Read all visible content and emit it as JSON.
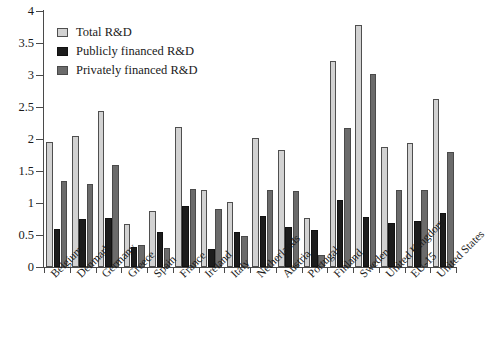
{
  "chart_data": {
    "type": "bar",
    "title": "",
    "subtitle": "",
    "xlabel": "",
    "ylabel": "",
    "ylim": [
      0,
      4
    ],
    "yticks": [
      "0",
      "0.5",
      "1",
      "1.5",
      "2",
      "2.5",
      "3",
      "3.5",
      "4"
    ],
    "ytick_values": [
      0,
      0.5,
      1,
      1.5,
      2,
      2.5,
      3,
      3.5,
      4
    ],
    "grid": false,
    "legend_position": "upper-left",
    "categories": [
      "Belgium",
      "Denmark",
      "Germany",
      "Greece",
      "Spain",
      "France",
      "Ireland",
      "Italy",
      "Netherlands",
      "Austria",
      "Portugal",
      "Finland",
      "Sweden",
      "United Kingdom",
      "EU-15",
      "United States"
    ],
    "series": [
      {
        "name": "Total R&D",
        "color": "#d2d2d2",
        "values": [
          1.95,
          2.05,
          2.44,
          0.67,
          0.88,
          2.18,
          1.21,
          1.02,
          2.02,
          1.83,
          0.76,
          3.22,
          3.78,
          1.88,
          1.93,
          2.62
        ]
      },
      {
        "name": "Publicly financed R&D",
        "color": "#1c1c1c",
        "values": [
          0.6,
          0.75,
          0.77,
          0.32,
          0.55,
          0.95,
          0.28,
          0.55,
          0.8,
          0.62,
          0.58,
          1.05,
          0.78,
          0.68,
          0.72,
          0.85
        ]
      },
      {
        "name": "Privately financed R&D",
        "color": "#6b6b6b",
        "values": [
          1.35,
          1.3,
          1.6,
          0.35,
          0.3,
          1.22,
          0.9,
          0.48,
          1.2,
          1.18,
          0.18,
          2.17,
          3.02,
          1.2,
          1.2,
          1.8
        ]
      }
    ]
  }
}
